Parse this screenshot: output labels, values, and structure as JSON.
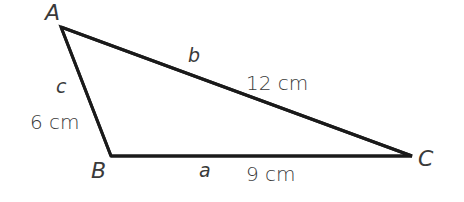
{
  "diagram": {
    "type": "triangle",
    "stroke_color": "#1a1a1a",
    "label_color": "#3a3a3a",
    "vertices": {
      "A": {
        "label": "A",
        "x": 61,
        "y": 27
      },
      "B": {
        "label": "B",
        "x": 111,
        "y": 156
      },
      "C": {
        "label": "C",
        "x": 412,
        "y": 156
      }
    },
    "sides": {
      "a": {
        "label": "a",
        "length": "9 cm",
        "from": "B",
        "to": "C"
      },
      "b": {
        "label": "b",
        "length": "12 cm",
        "from": "A",
        "to": "C"
      },
      "c": {
        "label": "c",
        "length": "6 cm",
        "from": "A",
        "to": "B"
      }
    }
  }
}
